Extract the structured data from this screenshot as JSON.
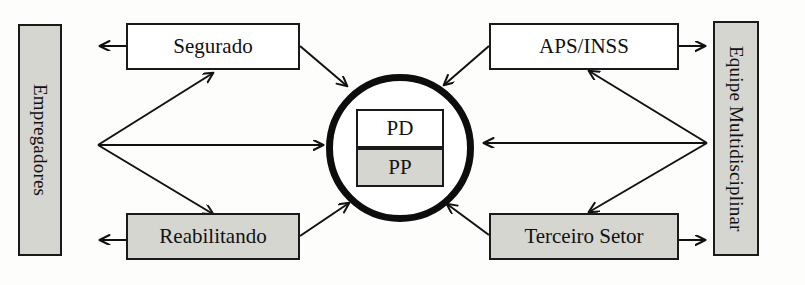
{
  "diagram": {
    "colors": {
      "fill_gray": "#d6d6d1",
      "fill_white": "#ffffff",
      "stroke": "#1a1a1a",
      "circle_stroke": "#0d0d0d",
      "background": "#fdfdfb"
    },
    "nodes": {
      "empregadores": {
        "label": "Empregadores",
        "fill": "gray",
        "orientation": "vertical"
      },
      "segurado": {
        "label": "Segurado",
        "fill": "white",
        "orientation": "horizontal"
      },
      "reabilitando": {
        "label": "Reabilitando",
        "fill": "gray",
        "orientation": "horizontal"
      },
      "aps_inss": {
        "label": "APS/INSS",
        "fill": "white",
        "orientation": "horizontal"
      },
      "terceiro_setor": {
        "label": "Terceiro Setor",
        "fill": "gray",
        "orientation": "horizontal"
      },
      "equipe": {
        "label": "Equipe Multidisciplinar",
        "fill": "gray",
        "orientation": "vertical"
      },
      "center_pd": {
        "label": "PD",
        "fill": "white"
      },
      "center_pp": {
        "label": "PP",
        "fill": "gray"
      }
    },
    "edges": [
      {
        "from": "segurado",
        "to": "empregadores",
        "style": "straight"
      },
      {
        "from": "segurado",
        "to": "circle",
        "style": "diagonal"
      },
      {
        "from": "empregadores",
        "to": "segurado",
        "style": "diagonal"
      },
      {
        "from": "empregadores",
        "to": "circle",
        "style": "straight"
      },
      {
        "from": "empregadores",
        "to": "reabilitando",
        "style": "diagonal"
      },
      {
        "from": "reabilitando",
        "to": "empregadores",
        "style": "straight"
      },
      {
        "from": "reabilitando",
        "to": "circle",
        "style": "diagonal"
      },
      {
        "from": "aps_inss",
        "to": "equipe",
        "style": "straight"
      },
      {
        "from": "aps_inss",
        "to": "circle",
        "style": "diagonal"
      },
      {
        "from": "equipe",
        "to": "aps_inss",
        "style": "diagonal"
      },
      {
        "from": "equipe",
        "to": "circle",
        "style": "straight"
      },
      {
        "from": "equipe",
        "to": "terceiro_setor",
        "style": "diagonal"
      },
      {
        "from": "terceiro_setor",
        "to": "equipe",
        "style": "straight"
      },
      {
        "from": "terceiro_setor",
        "to": "circle",
        "style": "diagonal"
      }
    ]
  }
}
